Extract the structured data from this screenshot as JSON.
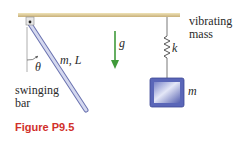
{
  "figure": {
    "caption": "Figure P9.5",
    "labels": {
      "swinging_bar_line1": "swinging",
      "swinging_bar_line2": "bar",
      "vibrating_mass_line1": "vibrating",
      "vibrating_mass_line2": "mass",
      "bar_params": "m, L",
      "angle": "θ",
      "gravity": "g",
      "spring_constant": "k",
      "mass": "m"
    },
    "colors": {
      "ceiling": "#d9c48e",
      "bar_fill": "#c9cde8",
      "bar_edge": "#6a72b0",
      "gravity_arrow": "#3f9a3a",
      "mass_fill": "#5a66b8",
      "mass_highlight": "#dfe3f6",
      "caption": "#d1302a"
    }
  }
}
